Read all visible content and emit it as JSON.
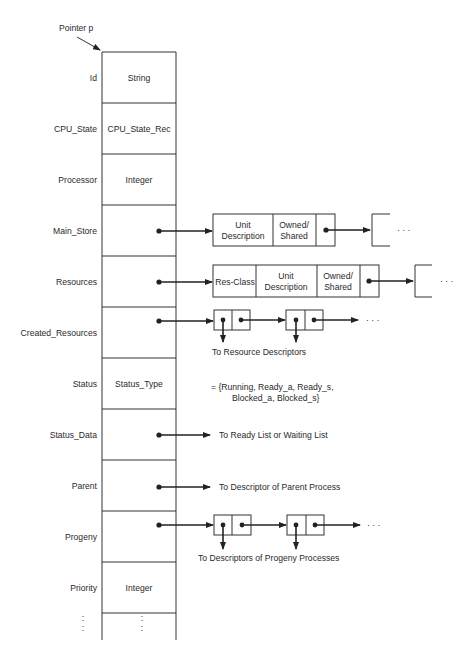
{
  "figure": {
    "pointer_label": "Pointer p",
    "fields": [
      {
        "name": "Id",
        "type": "String"
      },
      {
        "name": "CPU_State",
        "type": "CPU_State_Rec"
      },
      {
        "name": "Processor",
        "type": "Integer"
      },
      {
        "name": "Main_Store",
        "type": ""
      },
      {
        "name": "Resources",
        "type": ""
      },
      {
        "name": "Created_Resources",
        "type": ""
      },
      {
        "name": "Status",
        "type": "Status_Type"
      },
      {
        "name": "Status_Data",
        "type": ""
      },
      {
        "name": "Parent",
        "type": ""
      },
      {
        "name": "Progeny",
        "type": ""
      },
      {
        "name": "Priority",
        "type": "Integer"
      },
      {
        "name": ":",
        "type": ":"
      }
    ],
    "main_store_node": {
      "cells": [
        "Unit",
        "Description",
        "Owned/",
        "Shared"
      ],
      "ellipsis": "· · ·"
    },
    "resources_node": {
      "cells": [
        "Res-Class",
        "Unit",
        "Description",
        "Owned/",
        "Shared"
      ],
      "ellipsis": "· · ·"
    },
    "created_resources_caption": "To Resource Descriptors",
    "created_resources_ellipsis": "· · ·",
    "status_values_line1": "= {Running, Ready_a, Ready_s,",
    "status_values_line2": "Blocked_a, Blocked_s}",
    "status_data_target": "To Ready List or Waiting List",
    "parent_target": "To Descriptor of Parent Process",
    "progeny_caption": "To Descriptors of Progeny Processes",
    "progeny_ellipsis": "· · ·"
  }
}
